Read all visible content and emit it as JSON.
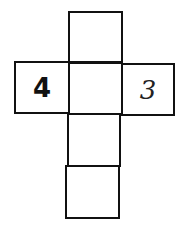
{
  "diagram": {
    "type": "cube-net",
    "cells": [
      {
        "id": "top",
        "label": ""
      },
      {
        "id": "left",
        "label": "4"
      },
      {
        "id": "center",
        "label": ""
      },
      {
        "id": "right",
        "label": "3"
      },
      {
        "id": "below-center",
        "label": ""
      },
      {
        "id": "bottom",
        "label": ""
      }
    ]
  }
}
